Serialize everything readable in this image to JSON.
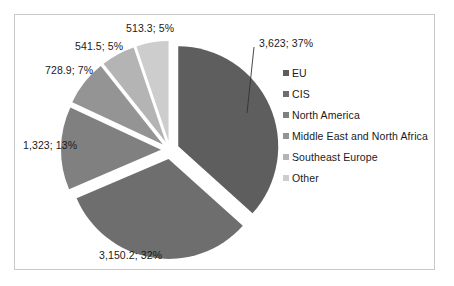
{
  "chart_data": {
    "type": "pie",
    "title": "",
    "legend_position": "right",
    "labels": [
      "EU",
      "CIS",
      "North America",
      " Middle East and North Africa",
      "Southeast Europe",
      "Other"
    ],
    "values": [
      3623,
      3150.2,
      1323,
      728.9,
      541.5,
      513.3
    ],
    "percents": [
      37,
      32,
      13,
      7,
      5,
      5
    ],
    "value_labels": [
      "3,623",
      "3,150.2",
      "1,323",
      "728.9",
      "541.5",
      "513.3"
    ],
    "percent_labels": [
      "37%",
      "32%",
      "13%",
      "7%",
      "5%",
      "5%"
    ],
    "data_labels": [
      "3,623; 37%",
      "3,150.2; 32%",
      "1,323; 13%",
      "728.9; 7%",
      "541.5; 5%",
      "513.3; 5%"
    ],
    "colors": [
      "#5e5e5e",
      "#6e6e6e",
      "#808080",
      "#949494",
      "#b4b4b4",
      "#cdcdcd"
    ],
    "exploded": true
  },
  "legend": {
    "items": [
      {
        "label": "EU",
        "color": "#5e5e5e"
      },
      {
        "label": "CIS",
        "color": "#6e6e6e"
      },
      {
        "label": "North America",
        "color": "#808080"
      },
      {
        "label": " Middle East and North Africa",
        "color": "#949494"
      },
      {
        "label": "Southeast Europe",
        "color": "#b4b4b4"
      },
      {
        "label": "Other",
        "color": "#cdcdcd"
      }
    ]
  },
  "labels": {
    "eu": "3,623; 37%",
    "cis": "3,150.2; 32%",
    "north_america": "1,323; 13%",
    "middle_east": "728.9; 7%",
    "southeast_europe": "541.5; 5%",
    "other": "513.3; 5%"
  },
  "frame": {
    "border_color": "#c9c9c9",
    "background": "#ffffff"
  }
}
